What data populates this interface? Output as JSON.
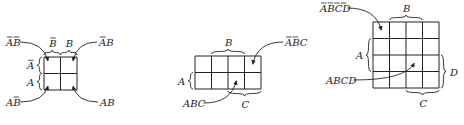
{
  "diagram": {
    "stroke_color": "#222222",
    "background": "#ffffff"
  },
  "maps": [
    {
      "id": "kmap-2var",
      "variables": 2,
      "grid": {
        "x": 44,
        "y": 57,
        "cols": 2,
        "rows": 2,
        "cell": 16.5
      },
      "braces": [
        {
          "label": "B̄",
          "letters": [
            {
              "ch": "B",
              "bar": true
            }
          ],
          "side": "top",
          "from": 0,
          "to": 1
        },
        {
          "label": "B",
          "letters": [
            {
              "ch": "B",
              "bar": false
            }
          ],
          "side": "top",
          "from": 1,
          "to": 2
        },
        {
          "label": "Ā",
          "letters": [
            {
              "ch": "A",
              "bar": true
            }
          ],
          "side": "left",
          "from": 0,
          "to": 1
        },
        {
          "label": "A",
          "letters": [
            {
              "ch": "A",
              "bar": false
            }
          ],
          "side": "left",
          "from": 1,
          "to": 2
        }
      ],
      "callouts": [
        {
          "label": "ĀB̄",
          "letters": [
            {
              "ch": "A",
              "bar": true
            },
            {
              "ch": "B",
              "bar": true
            }
          ],
          "text_x": 6,
          "text_y": 46,
          "cell": [
            0,
            0
          ],
          "corner": "tl"
        },
        {
          "label": "ĀB",
          "letters": [
            {
              "ch": "A",
              "bar": true
            },
            {
              "ch": "B",
              "bar": false
            }
          ],
          "text_x": 99,
          "text_y": 46,
          "cell": [
            1,
            0
          ],
          "corner": "tr"
        },
        {
          "label": "AB̄",
          "letters": [
            {
              "ch": "A",
              "bar": false
            },
            {
              "ch": "B",
              "bar": true
            }
          ],
          "text_x": 6,
          "text_y": 106,
          "cell": [
            0,
            1
          ],
          "corner": "bl"
        },
        {
          "label": "AB",
          "letters": [
            {
              "ch": "A",
              "bar": false
            },
            {
              "ch": "B",
              "bar": false
            }
          ],
          "text_x": 100,
          "text_y": 106,
          "cell": [
            1,
            1
          ],
          "corner": "br"
        }
      ]
    },
    {
      "id": "kmap-3var",
      "variables": 3,
      "grid": {
        "x": 195,
        "y": 56,
        "cols": 4,
        "rows": 2,
        "cell": 16.5
      },
      "braces": [
        {
          "label": "B",
          "letters": [
            {
              "ch": "B",
              "bar": false
            }
          ],
          "side": "top",
          "from": 1,
          "to": 3
        },
        {
          "label": "A",
          "letters": [
            {
              "ch": "A",
              "bar": false
            }
          ],
          "side": "left",
          "from": 1,
          "to": 2
        },
        {
          "label": "C",
          "letters": [
            {
              "ch": "C",
              "bar": false
            }
          ],
          "side": "bottom",
          "from": 2,
          "to": 4
        }
      ],
      "callouts": [
        {
          "label": "ĀB̄C",
          "letters": [
            {
              "ch": "A",
              "bar": true
            },
            {
              "ch": "B",
              "bar": true
            },
            {
              "ch": "C",
              "bar": false
            }
          ],
          "text_x": 285,
          "text_y": 46,
          "cell": [
            3,
            0
          ],
          "corner": "c"
        },
        {
          "label": "ABC",
          "letters": [
            {
              "ch": "A",
              "bar": false
            },
            {
              "ch": "B",
              "bar": false
            },
            {
              "ch": "C",
              "bar": false
            }
          ],
          "text_x": 183,
          "text_y": 107,
          "cell": [
            2,
            1
          ],
          "corner": "c"
        }
      ]
    },
    {
      "id": "kmap-4var",
      "variables": 4,
      "grid": {
        "x": 373,
        "y": 22,
        "cols": 4,
        "rows": 4,
        "cell": 16.5
      },
      "braces": [
        {
          "label": "B",
          "letters": [
            {
              "ch": "B",
              "bar": false
            }
          ],
          "side": "top",
          "from": 1,
          "to": 3
        },
        {
          "label": "A",
          "letters": [
            {
              "ch": "A",
              "bar": false
            }
          ],
          "side": "left",
          "from": 1,
          "to": 3
        },
        {
          "label": "D",
          "letters": [
            {
              "ch": "D",
              "bar": false
            }
          ],
          "side": "right",
          "from": 2,
          "to": 4
        },
        {
          "label": "C",
          "letters": [
            {
              "ch": "C",
              "bar": false
            }
          ],
          "side": "bottom",
          "from": 2,
          "to": 4
        }
      ],
      "callouts": [
        {
          "label": "ĀB̄C̄D̄",
          "letters": [
            {
              "ch": "A",
              "bar": true
            },
            {
              "ch": "B",
              "bar": true
            },
            {
              "ch": "C",
              "bar": true
            },
            {
              "ch": "D",
              "bar": true
            }
          ],
          "text_x": 320,
          "text_y": 12,
          "cell": [
            0,
            0
          ],
          "corner": "c"
        },
        {
          "label": "ABCD",
          "letters": [
            {
              "ch": "A",
              "bar": false
            },
            {
              "ch": "B",
              "bar": false
            },
            {
              "ch": "C",
              "bar": false
            },
            {
              "ch": "D",
              "bar": false
            }
          ],
          "text_x": 326,
          "text_y": 84,
          "cell": [
            2,
            2
          ],
          "corner": "c"
        }
      ]
    }
  ]
}
